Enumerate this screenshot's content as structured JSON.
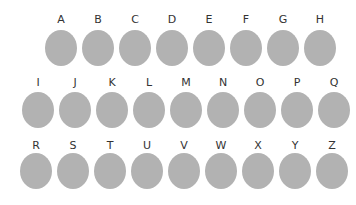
{
  "style": {
    "circle_color": "#b2b2b2",
    "label_color": "#333333"
  },
  "rows": [
    {
      "top": 14,
      "circle_offset": 16,
      "start_x": 45,
      "step": 37,
      "letters": [
        "A",
        "B",
        "C",
        "D",
        "E",
        "F",
        "G",
        "H"
      ]
    },
    {
      "top": 77,
      "circle_offset": 15,
      "start_x": 22,
      "step": 37,
      "letters": [
        "I",
        "J",
        "K",
        "L",
        "M",
        "N",
        "O",
        "P",
        "Q"
      ]
    },
    {
      "top": 140,
      "circle_offset": 13,
      "start_x": 20,
      "step": 37,
      "letters": [
        "R",
        "S",
        "T",
        "U",
        "V",
        "W",
        "X",
        "Y",
        "Z"
      ]
    }
  ]
}
